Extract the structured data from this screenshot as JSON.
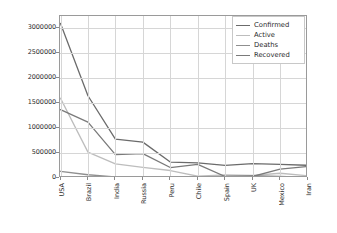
{
  "chart_data": {
    "type": "line",
    "title": "",
    "xlabel": "",
    "ylabel": "",
    "categories": [
      "USA",
      "Brazil",
      "India",
      "Russia",
      "Peru",
      "Chile",
      "Spain",
      "UK",
      "Mexico",
      "Iran"
    ],
    "ylim": [
      0,
      3250000
    ],
    "xlim": [
      0,
      9
    ],
    "grid": true,
    "legend_position": "top-right",
    "yticks": [
      0,
      500000,
      1000000,
      1500000,
      2000000,
      2500000,
      3000000
    ],
    "ytick_labels": [
      "0",
      "500000",
      "1000000",
      "1500000",
      "2000000",
      "2500000",
      "3000000"
    ],
    "series": [
      {
        "name": "Confirmed",
        "color": "#6b6b6b",
        "values": [
          3100000,
          1650000,
          780000,
          720000,
          320000,
          305000,
          255000,
          290000,
          275000,
          255000
        ]
      },
      {
        "name": "Active",
        "color": "#bdbdbd",
        "values": [
          1600000,
          520000,
          285000,
          215000,
          150000,
          35000,
          60000,
          50000,
          95000,
          45000
        ]
      },
      {
        "name": "Deaths",
        "color": "#8f8f8f",
        "values": [
          135000,
          65000,
          21000,
          11000,
          11000,
          6500,
          28000,
          45000,
          32000,
          13000
        ]
      },
      {
        "name": "Recovered",
        "color": "#7a7a7a",
        "values": [
          1370000,
          1120000,
          470000,
          490000,
          210000,
          275000,
          30000,
          30000,
          180000,
          230000
        ]
      }
    ]
  },
  "legend": {
    "items": [
      {
        "label": "Confirmed"
      },
      {
        "label": "Active"
      },
      {
        "label": "Deaths"
      },
      {
        "label": "Recovered"
      }
    ]
  }
}
